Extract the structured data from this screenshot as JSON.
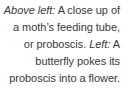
{
  "caption_block": {
    "text_color": "#3a3a3a",
    "background_color": "#ffffff",
    "alignment": "right",
    "captions": [
      {
        "lead_in": "Above left:",
        "text": " A close up of a moth’s feeding tube, or proboscis."
      },
      {
        "lead_in": "Left:",
        "text": " A butterfly pokes its proboscis into a flower."
      }
    ],
    "full_text": "Above left: A close up of a moth’s feeding tube, or proboscis. Left: A butterfly pokes its proboscis into a flower."
  }
}
